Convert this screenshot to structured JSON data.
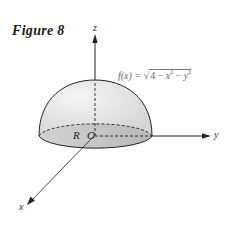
{
  "figure": {
    "title": "Figure 8",
    "formula": {
      "lhs": "f(x) = ",
      "radical_symbol": "√",
      "radicand_const": "4 − ",
      "x_term": "x",
      "y_term": "y",
      "exp": "2",
      "minus": " − "
    },
    "axes": {
      "x_label": "x",
      "y_label": "y",
      "z_label": "z"
    },
    "region_label": "R",
    "origin_label": "O",
    "colors": {
      "outline": "#222222",
      "dome_fill": "#e6e6e6",
      "base_fill": "#c8c8c8",
      "axis": "#333333"
    }
  }
}
